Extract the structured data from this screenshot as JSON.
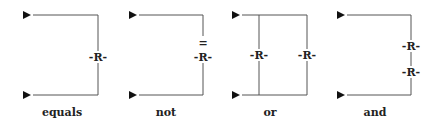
{
  "diagram": {
    "relation_symbol": "R",
    "panels": [
      {
        "label": "equals",
        "relations": [
          "-R-"
        ],
        "marker": ""
      },
      {
        "label": "not",
        "relations": [
          "-R-"
        ],
        "marker": "="
      },
      {
        "label": "or",
        "relations": [
          "-R-",
          "-R-"
        ],
        "marker": ""
      },
      {
        "label": "and",
        "relations": [
          "-R-",
          "-R-"
        ],
        "marker": ""
      }
    ],
    "line_color": "#555555",
    "arrow_color": "#111111"
  }
}
